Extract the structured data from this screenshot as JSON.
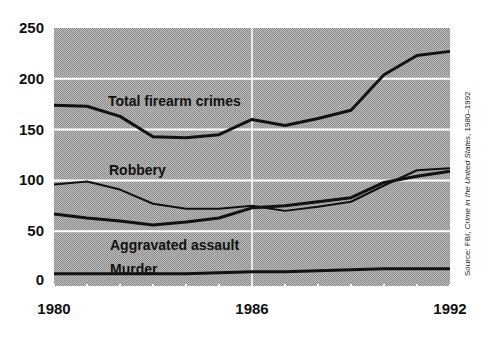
{
  "chart_data": {
    "type": "line",
    "title": "",
    "xlabel": "",
    "ylabel": "",
    "x": [
      1980,
      1981,
      1982,
      1983,
      1984,
      1985,
      1986,
      1987,
      1988,
      1989,
      1990,
      1991,
      1992
    ],
    "x_tick_labels": [
      "1980",
      "1986",
      "1992"
    ],
    "y_tick_labels": [
      "250",
      "200",
      "150",
      "100",
      "50",
      "0"
    ],
    "y_ticks": [
      250,
      200,
      150,
      100,
      50,
      0
    ],
    "ylim": [
      0,
      250
    ],
    "xlim": [
      1980,
      1992
    ],
    "grid": true,
    "legend": "inline labels",
    "series": [
      {
        "name": "Total firearm crimes",
        "values": [
          174,
          173,
          163,
          143,
          142,
          145,
          160,
          154,
          161,
          169,
          204,
          223,
          227
        ]
      },
      {
        "name": "Robbery",
        "values": [
          96,
          99,
          91,
          77,
          72,
          72,
          75,
          70,
          74,
          79,
          95,
          110,
          112
        ]
      },
      {
        "name": "Aggravated assault",
        "values": [
          67,
          63,
          60,
          56,
          59,
          63,
          73,
          75,
          79,
          83,
          98,
          104,
          109
        ]
      },
      {
        "name": "Murder",
        "values": [
          8,
          8,
          8,
          8,
          8,
          9,
          10,
          10,
          11,
          12,
          13,
          13,
          13
        ]
      }
    ],
    "source": "Source: FBI, Crime in the United States, 1980–1992"
  },
  "labels": {
    "total": "Total firearm crimes",
    "robbery": "Robbery",
    "assault": "Aggravated assault",
    "murder": "Murder",
    "source_prefix": "Source: FBI, ",
    "source_title": "Crime in the United States",
    "source_suffix": ", 1980–1992"
  },
  "colors": {
    "background_light": "#c4c4c4",
    "background_dark": "#8e8e8e",
    "line": "#111111",
    "grid": "#ffffff"
  }
}
